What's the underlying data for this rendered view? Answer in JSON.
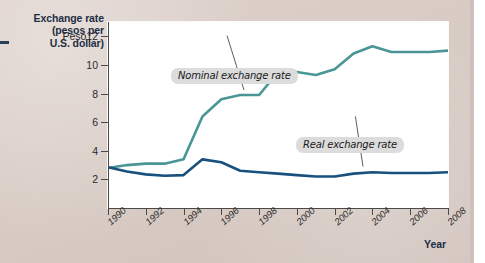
{
  "figure": {
    "y_axis_title": "Exchange rate (pesos per U.S. dollar)",
    "y_axis_title_lines": [
      "Exchange rate",
      "(pesos per",
      "U.S. dollar)"
    ],
    "x_axis_title": "Year",
    "peso_prefix": "Peso"
  },
  "callouts": {
    "nominal": "Nominal exchange rate",
    "real": "Real exchange rate"
  },
  "colors": {
    "nominal_line": "#4a9696",
    "real_line": "#18507e",
    "background": "#dbcec8",
    "plot_background": "#ffffff",
    "callout_background": "#dcdcdc",
    "title_text": "#1d2f45"
  },
  "chart_data": {
    "type": "line",
    "title": "",
    "xlabel": "Year",
    "ylabel": "Exchange rate (pesos per U.S. dollar)",
    "xlim": [
      1990,
      2008
    ],
    "ylim": [
      0,
      13
    ],
    "yticks": [
      2,
      4,
      6,
      8,
      10,
      12
    ],
    "ytick_labels": [
      "2",
      "4",
      "6",
      "8",
      "10",
      "Peso12"
    ],
    "xticks": [
      1990,
      1992,
      1994,
      1996,
      1998,
      2000,
      2002,
      2004,
      2006,
      2008
    ],
    "xtick_labels": [
      "1990",
      "1992",
      "1994",
      "1996",
      "1998",
      "2000",
      "2002",
      "2004",
      "2006",
      "2008"
    ],
    "grid": false,
    "legend": "annotations",
    "x": [
      1990,
      1991,
      1992,
      1993,
      1994,
      1995,
      1996,
      1997,
      1998,
      1999,
      2000,
      2001,
      2002,
      2003,
      2004,
      2005,
      2006,
      2007,
      2008
    ],
    "series": [
      {
        "name": "Nominal exchange rate",
        "color": "#4a9696",
        "values": [
          2.8,
          3.0,
          3.1,
          3.1,
          3.4,
          6.4,
          7.6,
          7.9,
          7.9,
          9.5,
          9.5,
          9.3,
          9.7,
          10.8,
          11.3,
          10.9,
          10.9,
          10.9,
          11.0
        ]
      },
      {
        "name": "Real exchange rate",
        "color": "#18507e",
        "values": [
          2.85,
          2.55,
          2.35,
          2.25,
          2.3,
          3.4,
          3.2,
          2.6,
          2.5,
          2.4,
          2.3,
          2.2,
          2.2,
          2.4,
          2.5,
          2.45,
          2.45,
          2.45,
          2.5
        ]
      }
    ]
  }
}
